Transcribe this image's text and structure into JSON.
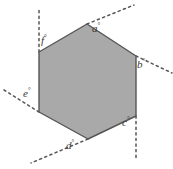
{
  "figure": {
    "type": "geometry-diagram",
    "shape_name": "hexagon",
    "fill_color": "#a9a9a9",
    "stroke_color": "#555555",
    "dash_color": "#555555",
    "background_color": "#ffffff",
    "label_color": "#3a3a3a",
    "degree_symbol": "°",
    "vertices": [
      {
        "name": "top",
        "x": 87,
        "y": 24
      },
      {
        "name": "upper-right",
        "x": 136,
        "y": 56
      },
      {
        "name": "lower-right",
        "x": 136,
        "y": 116
      },
      {
        "name": "bottom",
        "x": 88,
        "y": 139
      },
      {
        "name": "lower-left",
        "x": 39,
        "y": 112
      },
      {
        "name": "upper-left",
        "x": 39,
        "y": 52
      }
    ],
    "angles": [
      {
        "id": "a",
        "label": "a",
        "label_x": 92,
        "label_y": 22,
        "vertex": "top",
        "ray_from": {
          "x": 87,
          "y": 24
        },
        "ray_to": {
          "x": 134,
          "y": 5
        },
        "ray_direction": "up-right"
      },
      {
        "id": "b",
        "label": "b",
        "label_x": 137,
        "label_y": 58,
        "vertex": "upper-right",
        "ray_from": {
          "x": 136,
          "y": 56
        },
        "ray_to": {
          "x": 172,
          "y": 73
        },
        "ray_direction": "down-right"
      },
      {
        "id": "c",
        "label": "c",
        "label_x": 122,
        "label_y": 116,
        "vertex": "lower-right",
        "ray_from": {
          "x": 136,
          "y": 116
        },
        "ray_to": {
          "x": 136,
          "y": 158
        },
        "ray_direction": "down"
      },
      {
        "id": "d",
        "label": "d",
        "label_x": 66,
        "label_y": 139,
        "vertex": "bottom",
        "ray_from": {
          "x": 88,
          "y": 139
        },
        "ray_to": {
          "x": 31,
          "y": 163
        },
        "ray_direction": "down-left"
      },
      {
        "id": "e",
        "label": "e",
        "label_x": 23,
        "label_y": 87,
        "vertex": "lower-left",
        "ray_from": {
          "x": 39,
          "y": 112
        },
        "ray_to": {
          "x": 4,
          "y": 90
        },
        "ray_direction": "up-left"
      },
      {
        "id": "f",
        "label": "f",
        "label_x": 41,
        "label_y": 34,
        "vertex": "upper-left",
        "ray_from": {
          "x": 39,
          "y": 52
        },
        "ray_to": {
          "x": 39,
          "y": 9
        },
        "ray_direction": "up"
      }
    ]
  }
}
